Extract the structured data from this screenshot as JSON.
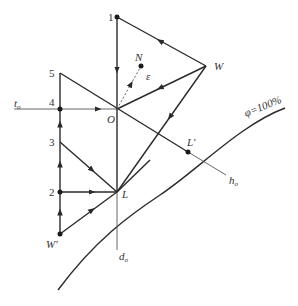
{
  "diagram": {
    "type": "psychrometric-process-diagram",
    "points": {
      "p1": {
        "label": "1",
        "x": 117,
        "y": 17
      },
      "p2": {
        "label": "2",
        "x": 60,
        "y": 192
      },
      "p3": {
        "label": "3",
        "x": 60,
        "y": 142
      },
      "p4": {
        "label": "4",
        "x": 60,
        "y": 109
      },
      "p5": {
        "label": "5",
        "x": 60,
        "y": 73
      },
      "O": {
        "label": "O",
        "x": 117,
        "y": 109
      },
      "W": {
        "label": "W",
        "x": 206,
        "y": 66
      },
      "N": {
        "label": "N",
        "x": 141,
        "y": 66
      },
      "L": {
        "label": "L",
        "x": 117,
        "y": 192
      },
      "Lprime": {
        "label": "L′",
        "x": 188,
        "y": 152
      },
      "Wprime": {
        "label": "W′",
        "x": 60,
        "y": 234
      }
    },
    "labels": {
      "epsilon": "ε",
      "t0": "t",
      "t0_sub": "o",
      "h0": "h",
      "h0_sub": "o",
      "d0": "d",
      "d0_sub": "o",
      "phi_curve": "φ=100%"
    },
    "colors": {
      "line": "#2a2a2a",
      "thin_line": "#555555",
      "text": "#333333"
    }
  }
}
